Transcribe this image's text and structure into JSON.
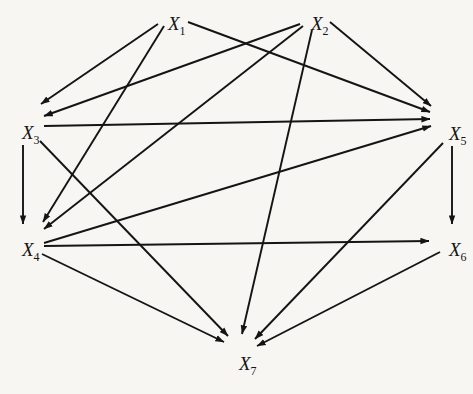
{
  "diagram": {
    "type": "directed-graph",
    "title": "",
    "background_color": "#f7f6f3",
    "line_color": "#141414",
    "nodes": [
      {
        "id": "X1",
        "label": "X",
        "subscript": "1",
        "x": 168,
        "y": 14
      },
      {
        "id": "X2",
        "label": "X",
        "subscript": "2",
        "x": 311,
        "y": 14
      },
      {
        "id": "X3",
        "label": "X",
        "subscript": "3",
        "x": 22,
        "y": 123
      },
      {
        "id": "X5",
        "label": "X",
        "subscript": "5",
        "x": 449,
        "y": 124
      },
      {
        "id": "X4",
        "label": "X",
        "subscript": "4",
        "x": 22,
        "y": 240
      },
      {
        "id": "X6",
        "label": "X",
        "subscript": "6",
        "x": 449,
        "y": 240
      },
      {
        "id": "X7",
        "label": "X",
        "subscript": "7",
        "x": 239,
        "y": 354
      }
    ],
    "edges": [
      {
        "from": "X1",
        "to": "X3",
        "x1": 158,
        "y1": 24,
        "x2": 41,
        "y2": 104
      },
      {
        "from": "X1",
        "to": "X4",
        "x1": 164,
        "y1": 26,
        "x2": 43,
        "y2": 222
      },
      {
        "from": "X1",
        "to": "X5",
        "x1": 188,
        "y1": 22,
        "x2": 430,
        "y2": 112
      },
      {
        "from": "X2",
        "to": "X3",
        "x1": 300,
        "y1": 24,
        "x2": 44,
        "y2": 116
      },
      {
        "from": "X2",
        "to": "X4",
        "x1": 303,
        "y1": 26,
        "x2": 44,
        "y2": 229
      },
      {
        "from": "X2",
        "to": "X5",
        "x1": 330,
        "y1": 22,
        "x2": 431,
        "y2": 106
      },
      {
        "from": "X2",
        "to": "X7",
        "x1": 312,
        "y1": 30,
        "x2": 242,
        "y2": 334
      },
      {
        "from": "X3",
        "to": "X4",
        "x1": 23,
        "y1": 145,
        "x2": 23,
        "y2": 224
      },
      {
        "from": "X3",
        "to": "X5",
        "x1": 44,
        "y1": 126,
        "x2": 430,
        "y2": 119
      },
      {
        "from": "X3",
        "to": "X7",
        "x1": 40,
        "y1": 141,
        "x2": 228,
        "y2": 336
      },
      {
        "from": "X4",
        "to": "X5",
        "x1": 44,
        "y1": 243,
        "x2": 431,
        "y2": 126
      },
      {
        "from": "X4",
        "to": "X6",
        "x1": 44,
        "y1": 246,
        "x2": 429,
        "y2": 241
      },
      {
        "from": "X4",
        "to": "X7",
        "x1": 42,
        "y1": 254,
        "x2": 224,
        "y2": 342
      },
      {
        "from": "X5",
        "to": "X6",
        "x1": 452,
        "y1": 146,
        "x2": 452,
        "y2": 224
      },
      {
        "from": "X5",
        "to": "X7",
        "x1": 443,
        "y1": 143,
        "x2": 255,
        "y2": 339
      },
      {
        "from": "X6",
        "to": "X7",
        "x1": 440,
        "y1": 252,
        "x2": 257,
        "y2": 346
      }
    ],
    "edge_list_text": [
      "X1 -> X3",
      "X1 -> X4",
      "X1 -> X5",
      "X2 -> X3",
      "X2 -> X4",
      "X2 -> X5",
      "X2 -> X7",
      "X3 -> X4",
      "X3 -> X5",
      "X3 -> X7",
      "X4 -> X5",
      "X4 -> X6",
      "X4 -> X7",
      "X5 -> X6",
      "X5 -> X7",
      "X6 -> X7"
    ],
    "node_count": 7,
    "edge_count": 16
  }
}
